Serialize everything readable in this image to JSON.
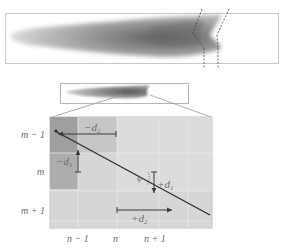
{
  "figure": {
    "type": "finite-difference grid diagram over plume image",
    "colors": {
      "background": "#ffffff",
      "frame": "#bdbdbd",
      "plume_dark": "#6f6f6f",
      "plume_light": "#d8d8d8",
      "grid_cell_light": "#d6d6d6",
      "grid_cell_dark": "#a9a9a9",
      "grid_line": "#e6e6e6",
      "arrow": "#3a3a3a",
      "label": "#6a6a6a"
    }
  },
  "grid": {
    "row_labels": [
      "m − 1",
      "m",
      "m + 1"
    ],
    "col_labels": [
      "n − 1",
      "n",
      "n + 1"
    ]
  },
  "annotations": {
    "minus_d2": "−d",
    "minus_d2_sub": "2",
    "minus_d1": "−d",
    "minus_d1_sub": "1",
    "plus_d1": "+d",
    "plus_d1_sub": "1",
    "plus_d2": "+d",
    "plus_d2_sub": "2",
    "phi": "φ"
  }
}
